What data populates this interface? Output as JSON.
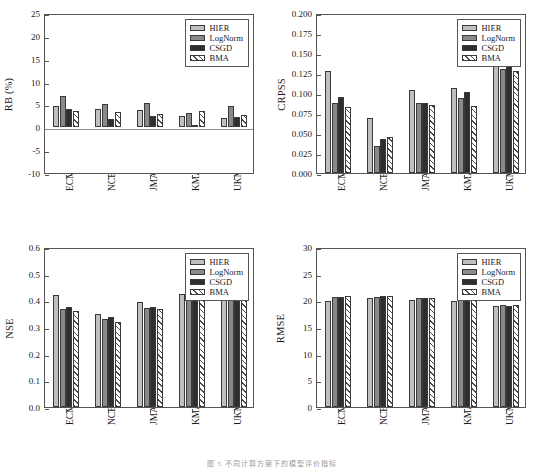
{
  "figure": {
    "series_names": [
      "HIER",
      "LogNorm",
      "CSGD",
      "BMA"
    ],
    "series_colors": [
      "#bfbfbf",
      "#8a8a8a",
      "#2e2e2e",
      "#ffffff"
    ],
    "categories": [
      "ECMWF",
      "NCEP",
      "JMA",
      "KMA",
      "UKMO"
    ],
    "caption": "图 5  不同计算方案下的模型评价指标"
  },
  "chart_data": [
    {
      "type": "bar",
      "title": "",
      "xlabel": "",
      "ylabel": "RB (%)",
      "categories": [
        "ECMWF",
        "NCEP",
        "JMA",
        "KMA",
        "UKMO"
      ],
      "series": [
        {
          "name": "HIER",
          "values": [
            4.6,
            4.0,
            3.8,
            2.5,
            2.1
          ]
        },
        {
          "name": "LogNorm",
          "values": [
            6.9,
            5.1,
            5.4,
            3.1,
            4.6
          ]
        },
        {
          "name": "CSGD",
          "values": [
            4.1,
            1.8,
            2.4,
            0.5,
            2.2
          ]
        },
        {
          "name": "BMA",
          "values": [
            3.5,
            3.3,
            2.9,
            3.6,
            2.7
          ]
        }
      ],
      "ylim": [
        -10,
        25
      ],
      "yticks": [
        -10,
        -5,
        0,
        5,
        10,
        15,
        20,
        25
      ],
      "ytick_labels": [
        "-10",
        "-5",
        "0",
        "5",
        "10",
        "15",
        "20",
        "25"
      ],
      "grid": false,
      "legend_position": "top-right",
      "zero_line": true
    },
    {
      "type": "bar",
      "title": "",
      "xlabel": "",
      "ylabel": "CRPSS",
      "categories": [
        "ECMWF",
        "NCEP",
        "JMA",
        "KMA",
        "UKMO"
      ],
      "series": [
        {
          "name": "HIER",
          "values": [
            0.128,
            0.069,
            0.104,
            0.106,
            0.138
          ]
        },
        {
          "name": "LogNorm",
          "values": [
            0.088,
            0.034,
            0.088,
            0.094,
            0.13
          ]
        },
        {
          "name": "CSGD",
          "values": [
            0.095,
            0.042,
            0.087,
            0.101,
            0.135
          ]
        },
        {
          "name": "BMA",
          "values": [
            0.082,
            0.045,
            0.085,
            0.084,
            0.127
          ]
        }
      ],
      "ylim": [
        0.0,
        0.2
      ],
      "yticks": [
        0.0,
        0.025,
        0.05,
        0.075,
        0.1,
        0.125,
        0.15,
        0.175,
        0.2
      ],
      "ytick_labels": [
        "0.000",
        "0.025",
        "0.050",
        "0.075",
        "0.100",
        "0.125",
        "0.150",
        "0.175",
        "0.200"
      ],
      "grid": false,
      "legend_position": "top-right",
      "zero_line": false
    },
    {
      "type": "bar",
      "title": "",
      "xlabel": "",
      "ylabel": "NSE",
      "categories": [
        "ECMWF",
        "NCEP",
        "JMA",
        "KMA",
        "UKMO"
      ],
      "series": [
        {
          "name": "HIER",
          "values": [
            0.42,
            0.348,
            0.393,
            0.424,
            0.451
          ]
        },
        {
          "name": "LogNorm",
          "values": [
            0.369,
            0.331,
            0.37,
            0.414,
            0.449
          ]
        },
        {
          "name": "CSGD",
          "values": [
            0.374,
            0.337,
            0.374,
            0.418,
            0.447
          ]
        },
        {
          "name": "BMA",
          "values": [
            0.361,
            0.32,
            0.367,
            0.402,
            0.44
          ]
        }
      ],
      "ylim": [
        0.0,
        0.6
      ],
      "yticks": [
        0.0,
        0.1,
        0.2,
        0.3,
        0.4,
        0.5,
        0.6
      ],
      "ytick_labels": [
        "0.0",
        "0.1",
        "0.2",
        "0.3",
        "0.4",
        "0.5",
        "0.6"
      ],
      "grid": false,
      "legend_position": "top-right",
      "zero_line": false
    },
    {
      "type": "bar",
      "title": "",
      "xlabel": "",
      "ylabel": "RMSE",
      "categories": [
        "ECMWF",
        "NCEP",
        "JMA",
        "KMA",
        "UKMO"
      ],
      "series": [
        {
          "name": "HIER",
          "values": [
            19.9,
            20.5,
            20.1,
            19.9,
            19.0
          ]
        },
        {
          "name": "LogNorm",
          "values": [
            20.6,
            20.7,
            20.5,
            20.0,
            19.1
          ]
        },
        {
          "name": "CSGD",
          "values": [
            20.7,
            20.8,
            20.5,
            20.0,
            19.0
          ]
        },
        {
          "name": "BMA",
          "values": [
            20.8,
            20.9,
            20.5,
            20.3,
            19.2
          ]
        }
      ],
      "ylim": [
        0,
        30
      ],
      "yticks": [
        0,
        5,
        10,
        15,
        20,
        25,
        30
      ],
      "ytick_labels": [
        "0",
        "5",
        "10",
        "15",
        "20",
        "25",
        "30"
      ],
      "grid": false,
      "legend_position": "top-right",
      "zero_line": false
    }
  ]
}
